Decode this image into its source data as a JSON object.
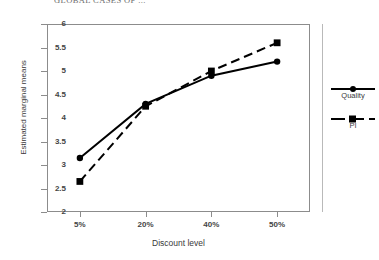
{
  "chart_data": {
    "type": "line",
    "title": "GLOBAL CASES OF ...",
    "xlabel": "Discount level",
    "ylabel": "Estimated marginal means",
    "categories": [
      "5%",
      "20%",
      "40%",
      "50%"
    ],
    "ylim": [
      2,
      6
    ],
    "yticks": [
      "6",
      "5.5",
      "5",
      "4.5",
      "4",
      "3.5",
      "3",
      "2.5",
      "2"
    ],
    "ytick_values": [
      6,
      5.5,
      5,
      4.5,
      4,
      3.5,
      3,
      2.5,
      2
    ],
    "grid": false,
    "legend_position": "right",
    "series": [
      {
        "name": "Quality",
        "values": [
          3.15,
          4.3,
          4.9,
          5.2
        ],
        "line_style": "solid",
        "marker": "circle",
        "color": "#000000"
      },
      {
        "name": "PI",
        "values": [
          2.65,
          4.25,
          5.0,
          5.6
        ],
        "line_style": "dashed",
        "marker": "square",
        "color": "#000000"
      }
    ]
  },
  "legend": {
    "entries": [
      {
        "label": "Quality",
        "marker": "circle-marker",
        "style": "solid-line-sample"
      },
      {
        "label": "PI",
        "marker": "square-marker",
        "style": "dashed-line-sample"
      }
    ]
  },
  "colors": {
    "axis": "#8c8c8c",
    "text": "#3a3a3a",
    "series": "#000000",
    "background": "#ffffff"
  }
}
